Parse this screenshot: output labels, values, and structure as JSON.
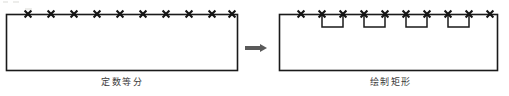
{
  "figure": {
    "title_visible": false,
    "separator_icon": "right-arrow-icon",
    "left_panel": {
      "caption": "定数等分",
      "shape_name": "rectangle",
      "markers": {
        "icon": "x-marker-icon",
        "count": 10,
        "placement": "top-edge",
        "x_positions": [
          28,
          51,
          74,
          97,
          120,
          143,
          166,
          189,
          212,
          232
        ],
        "y_position": 14
      },
      "outline": {
        "x": 6,
        "y": 14,
        "width": 231,
        "height": 56
      }
    },
    "right_panel": {
      "caption": "绘制矩形",
      "shape_name": "rectangle",
      "markers": {
        "icon": "x-marker-icon",
        "count": 10,
        "placement": "top-edge",
        "x_positions": [
          301,
          322,
          343,
          364,
          385,
          406,
          427,
          448,
          469,
          490
        ],
        "y_position": 14
      },
      "outline": {
        "x": 279,
        "y": 14,
        "width": 218,
        "height": 56
      },
      "sub_rectangles": {
        "shape_name": "small-rectangle",
        "count": 4,
        "depth": 13,
        "items": [
          {
            "x": 322,
            "width": 21
          },
          {
            "x": 364,
            "width": 21
          },
          {
            "x": 406,
            "width": 21
          },
          {
            "x": 448,
            "width": 21
          }
        ]
      }
    }
  },
  "colors": {
    "stroke": "#1a1a1a",
    "marker": "#141414",
    "caption_text": "#3b3b3b",
    "arrow": "#555555",
    "background": "#ffffff"
  }
}
